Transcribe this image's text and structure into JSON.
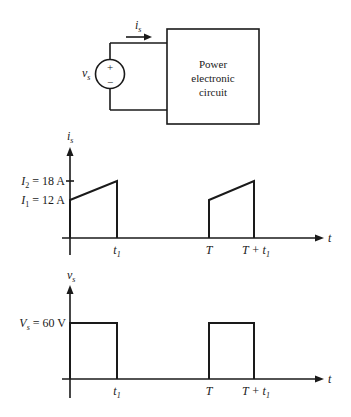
{
  "circuit": {
    "source_label": "v",
    "source_label_sub": "s",
    "plus": "+",
    "minus": "−",
    "current_label": "i",
    "current_label_sub": "s",
    "box_lines": [
      "Power",
      "electronic",
      "circuit"
    ]
  },
  "current_plot": {
    "y_label": "i",
    "y_label_sub": "s",
    "x_label": "t",
    "level_high": {
      "sym": "I",
      "sub": "2",
      "text": " = 18 A"
    },
    "level_low": {
      "sym": "I",
      "sub": "1",
      "text": " = 12 A"
    },
    "ticks": [
      {
        "sym": "t",
        "sub": "1"
      },
      {
        "sym": "T",
        "sub": ""
      },
      {
        "sym": "T + t",
        "sub": "1"
      }
    ]
  },
  "voltage_plot": {
    "y_label": "v",
    "y_label_sub": "s",
    "x_label": "t",
    "level": {
      "sym": "V",
      "sub": "s",
      "text": " = 60 V"
    },
    "ticks": [
      {
        "sym": "t",
        "sub": "1"
      },
      {
        "sym": "T",
        "sub": ""
      },
      {
        "sym": "T + t",
        "sub": "1"
      }
    ]
  }
}
